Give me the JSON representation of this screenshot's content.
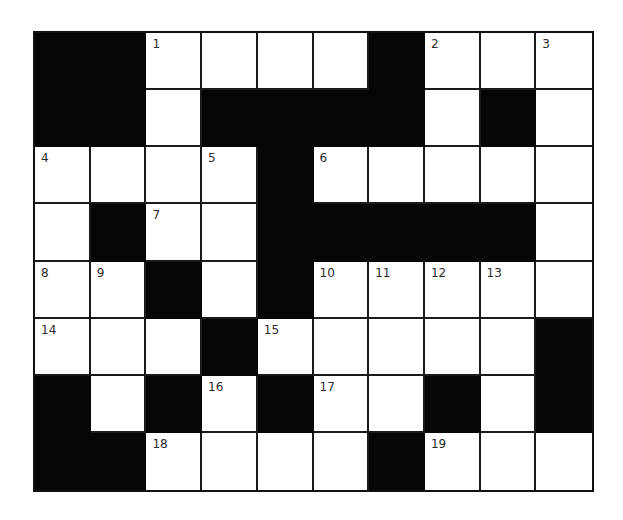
{
  "puzzle": {
    "type": "crossword",
    "columns": 10,
    "rows": 8,
    "colors": {
      "black_cell": "#050505",
      "white_cell": "#ffffff",
      "grid_line": "#1a1a1a",
      "number_text": "#2b2b2b"
    },
    "grid": [
      [
        "B",
        "B",
        "1",
        "",
        "",
        "",
        "B",
        "2",
        "",
        "3"
      ],
      [
        "B",
        "B",
        "",
        "B",
        "B",
        "B",
        "B",
        "",
        "B",
        ""
      ],
      [
        "4",
        "",
        "",
        "5",
        "B",
        "6",
        "",
        "",
        "",
        ""
      ],
      [
        "",
        "B",
        "7",
        "",
        "B",
        "B",
        "B",
        "B",
        "B",
        ""
      ],
      [
        "8",
        "9",
        "B",
        "",
        "B",
        "10",
        "11",
        "12",
        "13",
        ""
      ],
      [
        "14",
        "",
        "",
        "B",
        "15",
        "",
        "",
        "",
        "",
        "B"
      ],
      [
        "B",
        "",
        "B",
        "16",
        "B",
        "17",
        "",
        "B",
        "",
        "B"
      ],
      [
        "B",
        "B",
        "18",
        "",
        "",
        "",
        "B",
        "19",
        "",
        ""
      ]
    ],
    "clue_numbers": [
      "1",
      "2",
      "3",
      "4",
      "5",
      "6",
      "7",
      "8",
      "9",
      "10",
      "11",
      "12",
      "13",
      "14",
      "15",
      "16",
      "17",
      "18",
      "19"
    ]
  }
}
